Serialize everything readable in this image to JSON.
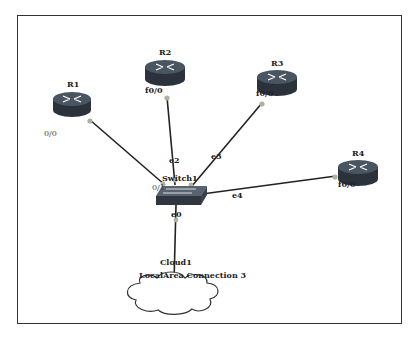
{
  "diagram": {
    "type": "network-topology",
    "nodes": [
      {
        "id": "R1",
        "label": "R1",
        "kind": "router",
        "port_label": "0/0"
      },
      {
        "id": "R2",
        "label": "R2",
        "kind": "router",
        "port_label": "f0/0"
      },
      {
        "id": "R3",
        "label": "R3",
        "kind": "router",
        "port_label": "f0/0"
      },
      {
        "id": "R4",
        "label": "R4",
        "kind": "router",
        "port_label": "f0/0"
      },
      {
        "id": "Switch1",
        "label": "Switch1",
        "kind": "switch",
        "port_label": "0/1"
      },
      {
        "id": "Cloud1",
        "label": "Cloud1",
        "kind": "cloud",
        "sublabel": "LocalArea Connection 3"
      }
    ],
    "links": [
      {
        "from": "R1",
        "to": "Switch1",
        "switch_port": ""
      },
      {
        "from": "R2",
        "to": "Switch1",
        "switch_port": "e2"
      },
      {
        "from": "R3",
        "to": "Switch1",
        "switch_port": "e3"
      },
      {
        "from": "R4",
        "to": "Switch1",
        "switch_port": "e4"
      },
      {
        "from": "Cloud1",
        "to": "Switch1",
        "switch_port": "e0"
      }
    ],
    "colors": {
      "router_top": "#3f4a57",
      "router_side": "#2b323b",
      "link": "#222222",
      "port_dot": "#a9b3a0",
      "frame": "#333333"
    }
  }
}
